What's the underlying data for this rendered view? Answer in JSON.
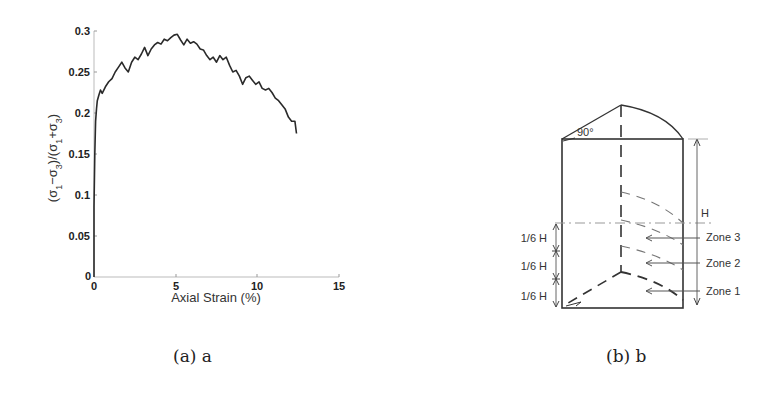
{
  "chart_data": [
    {
      "type": "line",
      "title": "",
      "xlabel": "Axial Strain (%)",
      "ylabel": "(σ1−σ3)/(σ1+σ3)",
      "xlim": [
        0,
        15
      ],
      "ylim": [
        0,
        0.3
      ],
      "xticks": [
        0,
        5,
        10,
        15
      ],
      "yticks": [
        0,
        0.05,
        0.1,
        0.15,
        0.2,
        0.25,
        0.3
      ],
      "xtick_labels": [
        "0",
        "5",
        "10",
        "15"
      ],
      "ytick_labels": [
        "0",
        "0.05",
        "0.1",
        "0.15",
        "0.2",
        "0.25",
        "0.3"
      ],
      "grid": false,
      "series": [
        {
          "name": "stress ratio",
          "x": [
            0.0,
            0.05,
            0.1,
            0.15,
            0.2,
            0.3,
            0.4,
            0.5,
            0.7,
            0.9,
            1.1,
            1.3,
            1.5,
            1.7,
            1.9,
            2.1,
            2.3,
            2.5,
            2.7,
            2.9,
            3.1,
            3.3,
            3.5,
            3.7,
            3.9,
            4.1,
            4.3,
            4.5,
            4.7,
            4.9,
            5.1,
            5.3,
            5.5,
            5.7,
            5.9,
            6.1,
            6.3,
            6.5,
            6.7,
            6.9,
            7.1,
            7.3,
            7.5,
            7.7,
            7.9,
            8.1,
            8.3,
            8.5,
            8.7,
            8.9,
            9.1,
            9.3,
            9.5,
            9.7,
            9.9,
            10.1,
            10.3,
            10.5,
            10.7,
            10.9,
            11.1,
            11.3,
            11.5,
            11.7,
            11.9,
            12.1,
            12.3,
            12.4
          ],
          "y": [
            0.085,
            0.15,
            0.19,
            0.205,
            0.215,
            0.222,
            0.228,
            0.224,
            0.232,
            0.238,
            0.242,
            0.25,
            0.256,
            0.262,
            0.255,
            0.25,
            0.262,
            0.268,
            0.265,
            0.272,
            0.28,
            0.27,
            0.278,
            0.283,
            0.286,
            0.284,
            0.29,
            0.288,
            0.292,
            0.295,
            0.296,
            0.289,
            0.283,
            0.29,
            0.285,
            0.287,
            0.284,
            0.278,
            0.277,
            0.27,
            0.265,
            0.268,
            0.262,
            0.27,
            0.265,
            0.268,
            0.258,
            0.25,
            0.252,
            0.245,
            0.235,
            0.243,
            0.245,
            0.24,
            0.235,
            0.238,
            0.23,
            0.228,
            0.23,
            0.225,
            0.218,
            0.215,
            0.21,
            0.205,
            0.195,
            0.19,
            0.19,
            0.175
          ]
        }
      ],
      "caption": "(a) a"
    },
    {
      "type": "diagram",
      "labels": {
        "angle": "90°",
        "height": "H",
        "segments": [
          "1/6 H",
          "1/6 H",
          "1/6 H"
        ],
        "zones": [
          "Zone 3",
          "Zone 2",
          "Zone 1"
        ]
      },
      "caption": "(b) b"
    }
  ],
  "figure_a": {
    "xlabel": "Axial Strain (%)",
    "ylabel_parts": {
      "open": "(σ",
      "s1": "1",
      "minus": "−σ",
      "s3": "3",
      "mid": ")/(σ",
      "s1b": "1",
      "plus": "+σ",
      "s3b": "3",
      "close": ")"
    },
    "yticks": [
      "0.3",
      "0.25",
      "0.2",
      "0.15",
      "0.1",
      "0.05",
      "0"
    ],
    "xticks": [
      "0",
      "5",
      "10",
      "15"
    ],
    "caption": "(a) a"
  },
  "figure_b": {
    "angle_label": "90°",
    "height_label": "H",
    "seg_labels": [
      "1/6 H",
      "1/6 H",
      "1/6 H"
    ],
    "zone_labels": [
      "Zone 3",
      "Zone 2",
      "Zone 1"
    ],
    "caption": "(b) b"
  }
}
